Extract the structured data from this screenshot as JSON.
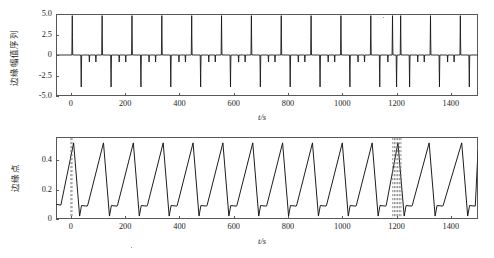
{
  "figure": {
    "panels": [
      {
        "id": "top",
        "ylabel": "边缘幅值序列",
        "xlabel": "t/s",
        "yticks": [
          "5.0",
          "2.5",
          "0",
          "-2.5",
          "-5.0"
        ],
        "ytick_values": [
          5.0,
          2.5,
          0,
          -2.5,
          -5.0
        ],
        "xticks": [
          "0",
          "200",
          "400",
          "600",
          "800",
          "1000",
          "1200",
          "1400"
        ],
        "xtick_values": [
          0,
          200,
          400,
          600,
          800,
          1000,
          1200,
          1400
        ]
      },
      {
        "id": "bottom",
        "ylabel": "边缘点",
        "xlabel": "t/s",
        "yticks": [
          "0.4",
          "0.2",
          "0"
        ],
        "ytick_values": [
          0.4,
          0.2,
          0
        ],
        "xticks": [
          "0",
          "200",
          "400",
          "600",
          "800",
          "1000",
          "1200",
          "1400"
        ],
        "xtick_values": [
          0,
          200,
          400,
          600,
          800,
          1000,
          1200,
          1400
        ]
      }
    ]
  },
  "chart_data": [
    {
      "type": "line",
      "panel": "top",
      "title": "",
      "xlabel": "t/s",
      "ylabel": "边缘幅值序列",
      "xlim": [
        -55,
        1500
      ],
      "ylim": [
        -5.0,
        5.0
      ],
      "grid": false,
      "legend": null,
      "series_name": "edge amplitude sequence",
      "description": "Spike train: one tall positive spike near each cycle start followed by a deep negative spike and two small negative notches; a doubled/anomalous spike pair occurs near t=1200 s.",
      "cycle_period": 110,
      "positive_spike_amplitude": 4.8,
      "negative_spike_amplitude": -3.9,
      "minor_notch_amplitude": -0.85,
      "baseline": 0,
      "positive_spike_times": [
        5,
        115,
        225,
        335,
        445,
        555,
        665,
        775,
        885,
        995,
        1105,
        1185,
        1215,
        1325,
        1435
      ],
      "negative_spike_times": [
        38,
        148,
        258,
        368,
        478,
        588,
        698,
        808,
        918,
        1028,
        1138,
        1200,
        1248,
        1358,
        1468
      ],
      "minor_notch_times": [
        68,
        92,
        178,
        202,
        288,
        312,
        398,
        422,
        508,
        532,
        618,
        642,
        728,
        752,
        838,
        862,
        948,
        972,
        1058,
        1082,
        1168,
        1278,
        1302,
        1388,
        1412
      ],
      "anomaly_region": [
        1180,
        1230
      ]
    },
    {
      "type": "line",
      "panel": "bottom",
      "title": "",
      "xlabel": "t/s",
      "ylabel": "边缘点",
      "xlim": [
        -55,
        1500
      ],
      "ylim": [
        0,
        0.56
      ],
      "grid": false,
      "legend": null,
      "series_name": "edge points",
      "description": "Sawtooth: slow linear rise to a peak then abrupt drop below baseline to a trough, a short flat shelf, then the next rise. Dashed grey vertical marker lines are drawn at t=0 and a dense cluster near t=1200 s.",
      "cycle_period": 110,
      "peak_value": 0.52,
      "trough_value": 0.02,
      "shelf_value": 0.1,
      "peak_times": [
        10,
        120,
        230,
        340,
        450,
        560,
        670,
        780,
        890,
        1000,
        1110,
        1205,
        1320,
        1440
      ],
      "trough_times": [
        32,
        142,
        252,
        362,
        472,
        582,
        692,
        802,
        912,
        1022,
        1132,
        1228,
        1342
      ],
      "marker_lines": [
        0,
        4,
        1186,
        1192,
        1198,
        1204,
        1210,
        1216
      ],
      "anomaly_region": [
        1180,
        1220
      ]
    }
  ]
}
